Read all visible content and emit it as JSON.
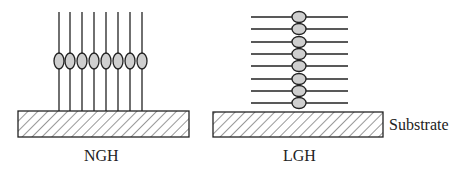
{
  "diagram": {
    "panels": [
      {
        "id": "ngh",
        "label": "NGH",
        "orientation": "vertical",
        "molecule_count": 8
      },
      {
        "id": "lgh",
        "label": "LGH",
        "orientation": "horizontal",
        "molecule_count": 8
      }
    ],
    "substrate_label": "Substrate",
    "colors": {
      "line": "#222222",
      "head_fill": "#cfcfcf",
      "hatch": "#333333"
    }
  }
}
